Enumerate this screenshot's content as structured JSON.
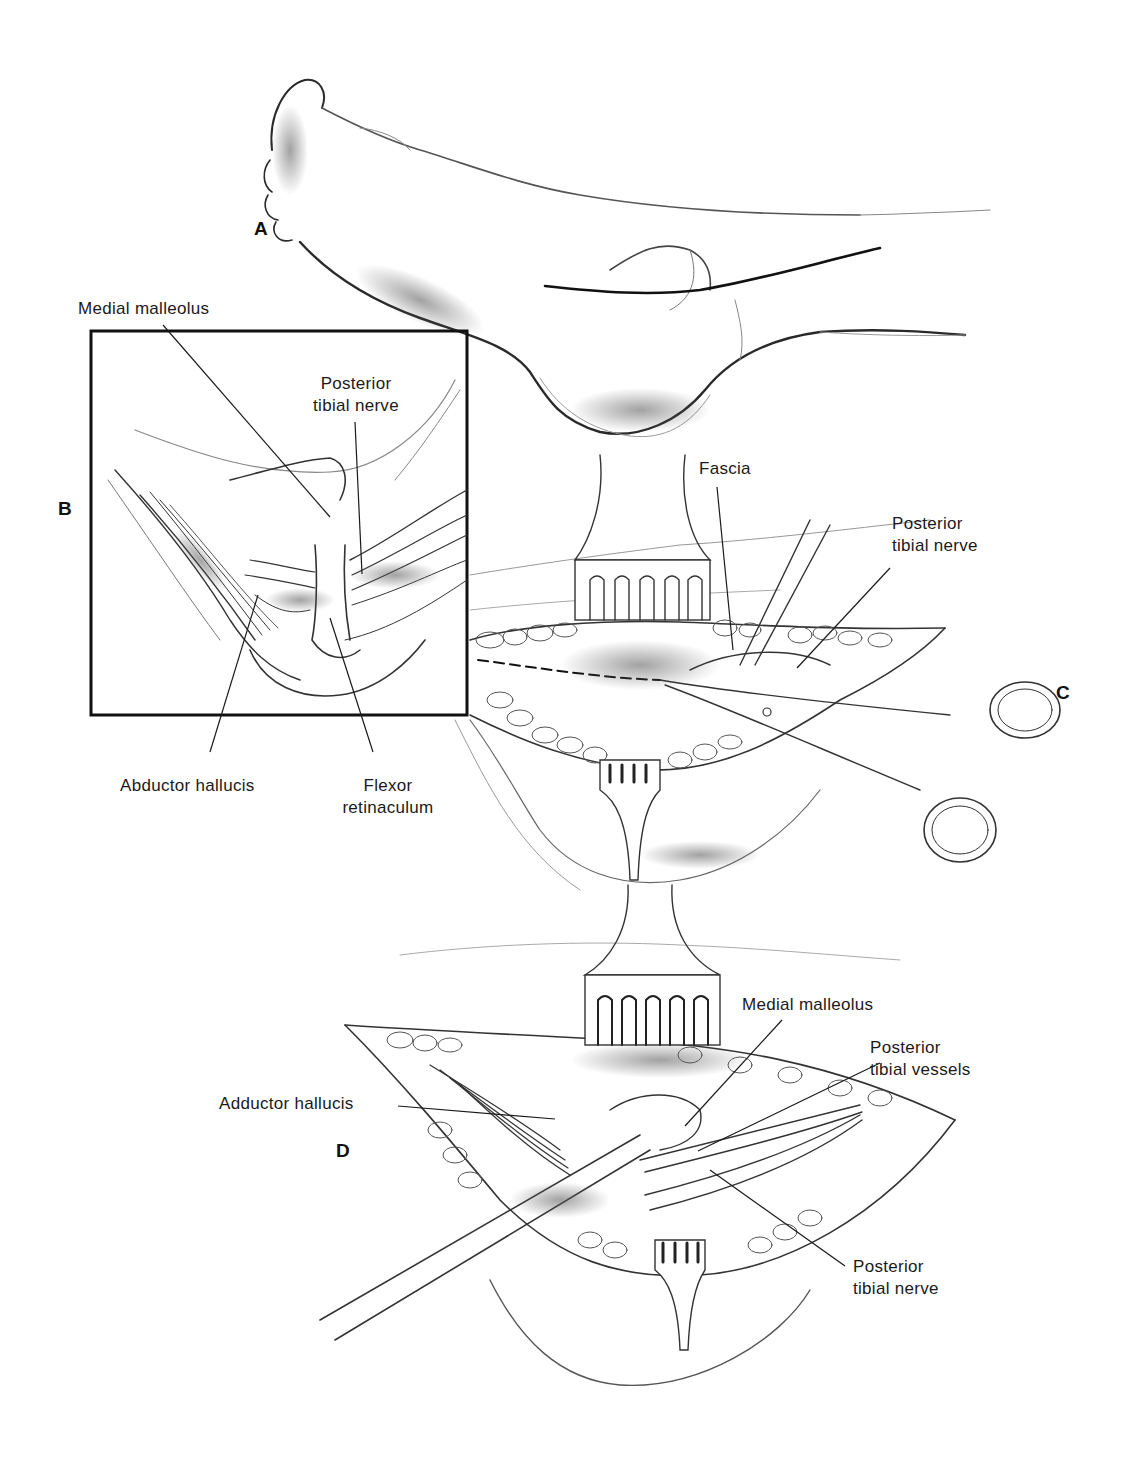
{
  "figure": {
    "panels": [
      {
        "id": "A",
        "letter": "A",
        "description": "Medial view of foot with curved incision line behind medial malleolus"
      },
      {
        "id": "B",
        "letter": "B",
        "description": "Boxed inset of tarsal tunnel anatomy"
      },
      {
        "id": "C",
        "letter": "C",
        "description": "Retracted incision; scissors dividing fascia along dashed line"
      },
      {
        "id": "D",
        "letter": "D",
        "description": "Exposed tarsal tunnel contents with retractors"
      }
    ],
    "labels": {
      "b_medial_malleolus": "Medial malleolus",
      "b_posterior_tibial_nerve_1": "Posterior",
      "b_posterior_tibial_nerve_2": "tibial nerve",
      "b_abductor_hallucis": "Abductor hallucis",
      "b_flexor_retinaculum_1": "Flexor",
      "b_flexor_retinaculum_2": "retinaculum",
      "c_fascia": "Fascia",
      "c_posterior_tibial_nerve_1": "Posterior",
      "c_posterior_tibial_nerve_2": "tibial nerve",
      "d_medial_malleolus": "Medial malleolus",
      "d_posterior_tibial_vessels_1": "Posterior",
      "d_posterior_tibial_vessels_2": "tibial vessels",
      "d_adductor_hallucis": "Adductor hallucis",
      "d_posterior_tibial_nerve_1": "Posterior",
      "d_posterior_tibial_nerve_2": "tibial nerve"
    },
    "colors": {
      "ink": "#1a1a1a",
      "shade": "#6b6b6b",
      "light": "#b5b5b5",
      "background": "#ffffff"
    }
  }
}
